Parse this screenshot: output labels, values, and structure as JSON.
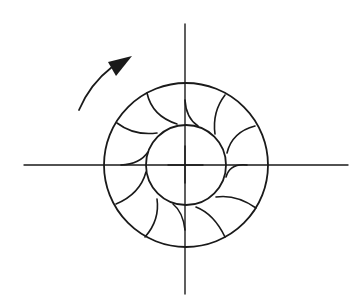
{
  "diagram": {
    "canvas": {
      "width": 360,
      "height": 299
    },
    "colors": {
      "line": "#1a1a1a",
      "background": "#ffffff"
    },
    "center": {
      "x": 185,
      "y": 165
    },
    "axes": {
      "horizontal": {
        "x1": 24,
        "x2": 348,
        "y": 165
      },
      "vertical": {
        "x": 185,
        "y1": 24,
        "y2": 294
      }
    },
    "outer_circle": {
      "cx": 186,
      "cy": 165,
      "r": 82
    },
    "inner_circle": {
      "cx": 186,
      "cy": 165,
      "r": 40
    },
    "center_cross": {
      "x1": 168,
      "x2": 203,
      "y1": 146,
      "y2": 183
    },
    "vane_count": 12,
    "vanes": [
      {
        "d": "M 185 100 Q 186 118 198 126"
      },
      {
        "d": "M 147 93 Q 152 116 177 124"
      },
      {
        "d": "M 117 123 Q 134 136 157 133"
      },
      {
        "d": "M 121 165 Q 140 164 148 152"
      },
      {
        "d": "M 116 204 Q 140 194 146 172"
      },
      {
        "d": "M 145 237 Q 160 220 157 199"
      },
      {
        "d": "M 185 230 Q 183 212 173 204"
      },
      {
        "d": "M 225 237 Q 214 214 196 207"
      },
      {
        "d": "M 256 208 Q 236 194 216 197"
      },
      {
        "d": "M 247 165 Q 230 163 226 177"
      },
      {
        "d": "M 255 126 Q 232 132 227 153"
      },
      {
        "d": "M 225 95 Q 212 112 215 134"
      }
    ],
    "rotation_arrow": {
      "direction": "clockwise",
      "shaft": {
        "d": "M 79 110 Q 90 84 112 67"
      },
      "head": {
        "points": "132,56 108,62 116,76"
      }
    }
  }
}
